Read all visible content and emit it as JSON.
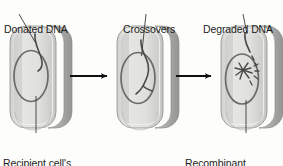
{
  "figure": {
    "background_color": "#fdfdfc",
    "stages": 3
  },
  "labels": {
    "donated_dna": "Donated DNA",
    "crossovers": "Crossovers",
    "degraded_dna": "Degraded DNA",
    "recipient_line1": "Recipient cell's",
    "recipient_line2": "chromosome",
    "recombinant_line1": "Recombinant",
    "recombinant_line2": "chromosome"
  },
  "colors": {
    "cell_face": "#dcdcda",
    "cell_face_light": "#ebebe9",
    "cell_side": "#b4b4b2",
    "cell_side_dark": "#9d9d9b",
    "cell_outline": "#8d8d8b",
    "chromosome": "#6b6b69",
    "dna_strand": "#4a4a48",
    "arrow": "#111111",
    "leader_line": "#3a3a38",
    "text": "#1d1d1b"
  },
  "cells": [
    {
      "name": "recipient-cell",
      "stage": 1,
      "x": 10,
      "y": 26,
      "width": 52,
      "height": 102,
      "has_chromosome": true,
      "has_donated_dna": true,
      "has_crossovers": false,
      "has_degraded_fragments": false
    },
    {
      "name": "crossover-cell",
      "stage": 2,
      "x": 117,
      "y": 26,
      "width": 52,
      "height": 102,
      "has_chromosome": true,
      "has_donated_dna": true,
      "has_crossovers": true,
      "has_degraded_fragments": false
    },
    {
      "name": "recombinant-cell",
      "stage": 3,
      "x": 221,
      "y": 26,
      "width": 52,
      "height": 102,
      "has_chromosome": true,
      "has_donated_dna": true,
      "has_crossovers": false,
      "has_degraded_fragments": true
    }
  ],
  "arrows": [
    {
      "name": "arrow-stage1-to-stage2",
      "x1": 70,
      "y1": 76,
      "x2": 110,
      "y2": 76
    },
    {
      "name": "arrow-stage2-to-stage3",
      "x1": 176,
      "y1": 76,
      "x2": 214,
      "y2": 76
    }
  ],
  "leader_lines": [
    {
      "name": "leader-donated-dna",
      "x1": 19,
      "y1": 14,
      "x2": 35,
      "y2": 42
    },
    {
      "name": "leader-crossovers",
      "x1": 146,
      "y1": 14,
      "x2": 142,
      "y2": 55
    },
    {
      "name": "leader-degraded-dna",
      "x1": 243,
      "y1": 14,
      "x2": 248,
      "y2": 34
    },
    {
      "name": "leader-recipient-chromosome",
      "x1": 36,
      "y1": 96,
      "x2": 36,
      "y2": 133
    },
    {
      "name": "leader-recombinant-chromosome",
      "x1": 246,
      "y1": 98,
      "x2": 246,
      "y2": 133
    }
  ]
}
